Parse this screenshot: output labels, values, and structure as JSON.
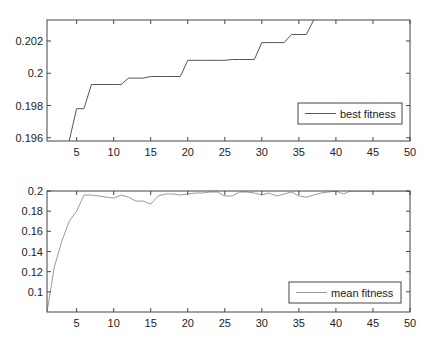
{
  "chart_data": [
    {
      "type": "line",
      "title": "",
      "xlabel": "",
      "ylabel": "",
      "xlim": [
        1,
        50
      ],
      "ylim": [
        0.1958,
        0.2033
      ],
      "grid": false,
      "legend_position": "lower right",
      "x_ticks": [
        5,
        10,
        15,
        20,
        25,
        30,
        35,
        40,
        45,
        50
      ],
      "y_ticks": [
        0.196,
        0.198,
        0.2,
        0.202
      ],
      "y_tick_labels": [
        "0.196",
        "0.198",
        "0.2",
        "0.202"
      ],
      "x_tick_labels": [
        "5",
        "10",
        "15",
        "20",
        "25",
        "30",
        "35",
        "40",
        "45",
        "50"
      ],
      "series": [
        {
          "name": "best fitness",
          "color": "#555555",
          "x": [
            1,
            2,
            3,
            4,
            5,
            6,
            7,
            8,
            9,
            10,
            11,
            12,
            13,
            14,
            15,
            16,
            17,
            18,
            19,
            20,
            21,
            22,
            23,
            24,
            25,
            26,
            27,
            28,
            29,
            30,
            31,
            32,
            33,
            34,
            35,
            36,
            37
          ],
          "values": [
            0.1955,
            0.1955,
            0.1955,
            0.1958,
            0.1978,
            0.1978,
            0.1993,
            0.1993,
            0.1993,
            0.1993,
            0.1993,
            0.1997,
            0.1997,
            0.1997,
            0.1998,
            0.1998,
            0.1998,
            0.1998,
            0.1998,
            0.2008,
            0.2008,
            0.2008,
            0.2008,
            0.2008,
            0.2008,
            0.20085,
            0.20085,
            0.20085,
            0.20085,
            0.2019,
            0.2019,
            0.2019,
            0.2019,
            0.2024,
            0.2024,
            0.2024,
            0.2033
          ]
        }
      ]
    },
    {
      "type": "line",
      "title": "",
      "xlabel": "",
      "ylabel": "",
      "xlim": [
        1,
        50
      ],
      "ylim": [
        0.08,
        0.2
      ],
      "grid": false,
      "legend_position": "lower right",
      "x_ticks": [
        5,
        10,
        15,
        20,
        25,
        30,
        35,
        40,
        45,
        50
      ],
      "y_ticks": [
        0.1,
        0.12,
        0.14,
        0.16,
        0.18,
        0.2
      ],
      "y_tick_labels": [
        "0.1",
        "0.12",
        "0.14",
        "0.16",
        "0.18",
        "0.2"
      ],
      "x_tick_labels": [
        "5",
        "10",
        "15",
        "20",
        "25",
        "30",
        "35",
        "40",
        "45",
        "50"
      ],
      "series": [
        {
          "name": "mean fitness",
          "color": "#9a9a9a",
          "x": [
            1,
            2,
            3,
            4,
            5,
            6,
            7,
            8,
            9,
            10,
            11,
            12,
            13,
            14,
            15,
            16,
            17,
            18,
            19,
            20,
            21,
            22,
            23,
            24,
            25,
            26,
            27,
            28,
            29,
            30,
            31,
            32,
            33,
            34,
            35,
            36,
            37,
            38,
            39,
            40,
            41,
            42,
            43,
            44,
            45,
            46,
            47,
            48,
            49,
            50
          ],
          "values": [
            0.08,
            0.125,
            0.15,
            0.17,
            0.18,
            0.196,
            0.196,
            0.195,
            0.194,
            0.193,
            0.196,
            0.194,
            0.19,
            0.19,
            0.187,
            0.195,
            0.197,
            0.197,
            0.196,
            0.197,
            0.198,
            0.198,
            0.199,
            0.199,
            0.195,
            0.195,
            0.199,
            0.199,
            0.198,
            0.196,
            0.198,
            0.195,
            0.197,
            0.199,
            0.195,
            0.194,
            0.196,
            0.198,
            0.199,
            0.2,
            0.197,
            0.2,
            0.2,
            0.2,
            0.2,
            0.2,
            0.2,
            0.2,
            0.2,
            0.2
          ]
        }
      ]
    }
  ],
  "legends": {
    "top": "best fitness",
    "bottom": "mean fitness"
  }
}
